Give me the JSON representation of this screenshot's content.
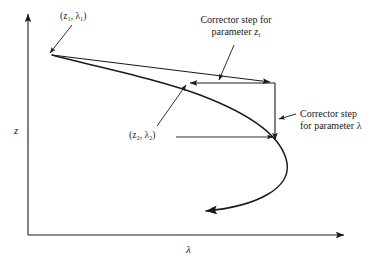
{
  "figure": {
    "axes": {
      "y_label": "z",
      "x_label": "λ"
    },
    "point_labels": {
      "p1": "(z₁, λ₁)",
      "p2": "(z₂, λ₂)"
    },
    "annotations": {
      "corrector_z_line1": "Corrector step for",
      "corrector_z_line2": "parameter z",
      "corrector_z_subscript": "i",
      "corrector_lambda_line1": "Corrector step",
      "corrector_lambda_line2": "for parameter λ"
    },
    "colors": {
      "stroke": "#1a1a1a",
      "background": "#ffffff"
    }
  }
}
